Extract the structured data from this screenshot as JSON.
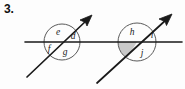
{
  "figure": {
    "problem_number": "3.",
    "colors": {
      "stroke": "#1a1a1a",
      "circle_stroke": "#5a5a5a",
      "shade_fill": "#c9c9c9",
      "background": "#fdfdfd",
      "label_color": "#1a1a1a"
    },
    "horizontal_line": {
      "name": "horizontal-line",
      "x1": 25,
      "y1": 42,
      "x2": 182,
      "y2": 42
    },
    "intersections": [
      {
        "name": "left-intersection",
        "circle": {
          "cx": 62,
          "cy": 42,
          "r": 18
        },
        "transversal": {
          "x1": 27,
          "y1": 77,
          "x2": 92,
          "y2": 15,
          "arrow": "up-right"
        },
        "shaded_sector": false,
        "labels": [
          {
            "id": "e",
            "text": "e",
            "x": 58,
            "y": 33
          },
          {
            "id": "d",
            "text": "d",
            "x": 73,
            "y": 37
          },
          {
            "id": "f",
            "text": "f",
            "x": 49,
            "y": 50
          },
          {
            "id": "g",
            "text": "g",
            "x": 65,
            "y": 53
          }
        ]
      },
      {
        "name": "right-intersection",
        "circle": {
          "cx": 137,
          "cy": 42,
          "r": 19
        },
        "transversal": {
          "x1": 97,
          "y1": 83,
          "x2": 172,
          "y2": 14,
          "arrow": "up-right"
        },
        "shaded_sector": true,
        "labels": [
          {
            "id": "h",
            "text": "h",
            "x": 132,
            "y": 33
          },
          {
            "id": "i",
            "text": "i",
            "x": 152,
            "y": 36
          },
          {
            "id": "j",
            "text": "j",
            "x": 142,
            "y": 54
          }
        ]
      }
    ]
  }
}
